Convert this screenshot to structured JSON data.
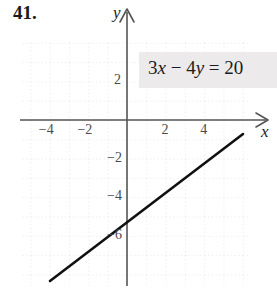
{
  "figure": {
    "problem_number": "41.",
    "equation_label": "3x − 4y = 20",
    "equation_parts": {
      "coef_x": "3",
      "var_x": "x",
      "operator": "−",
      "coef_y": "4",
      "var_y": "y",
      "equals": "=",
      "constant": "20"
    },
    "x_axis_name": "x",
    "y_axis_name": "y",
    "colors": {
      "line": "#111111",
      "axis": "#555555",
      "grid": "#d8d6d6",
      "equation_box_bg": "#eceaea",
      "text": "#1c1c1c",
      "tick_text": "#4a4a4a"
    }
  },
  "chart_data": {
    "type": "line",
    "title": "",
    "subtitle": "",
    "xlabel": "x",
    "ylabel": "y",
    "equation": "3x - 4y = 20",
    "slope": 0.75,
    "y_intercept": -5,
    "x_intercept": 6.6667,
    "xlim": [
      -5.5,
      6.3
    ],
    "ylim": [
      -8.3,
      4.1
    ],
    "grid": true,
    "grid_style": "dotted",
    "grid_step": 1,
    "legend": "none",
    "x_ticks": [
      -4,
      -2,
      2,
      4
    ],
    "x_tick_labels": [
      "−4",
      "−2",
      "2",
      "4"
    ],
    "y_ticks": [
      2,
      -2,
      -4,
      -6
    ],
    "y_tick_labels": [
      "2",
      "−2",
      "−4",
      "−6"
    ],
    "series": [
      {
        "name": "3x - 4y = 20",
        "points": [
          {
            "x": -4.0,
            "y": -8.0
          },
          {
            "x": 6.0,
            "y": -0.5
          }
        ]
      }
    ],
    "annotations": [
      {
        "text": "3x − 4y = 20",
        "x": 1.1,
        "y": 2.7
      }
    ]
  }
}
